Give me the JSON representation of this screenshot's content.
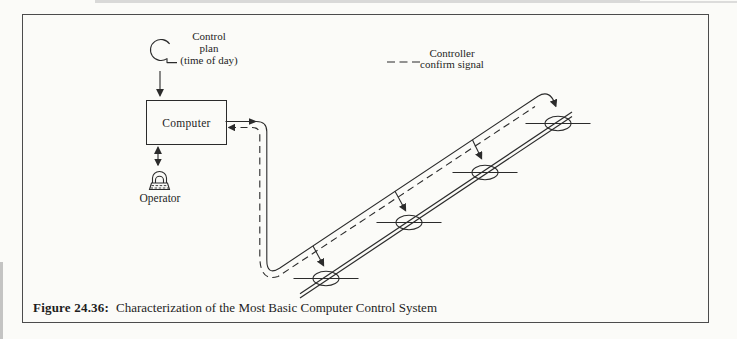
{
  "figure": {
    "caption_label": "Figure 24.36:",
    "caption_text": "Characterization of the Most Basic Computer Control System"
  },
  "diagram": {
    "control_plan": {
      "line1": "Control",
      "line2": "plan",
      "line3": "(time of day)"
    },
    "computer_label": "Computer",
    "operator_label": "Operator",
    "legend": {
      "line1": "Controller",
      "line2": "confirm signal"
    },
    "signalized_intersections_count": 4,
    "flows": {
      "command": "Computer to signalized intersections (solid line with arrows)",
      "confirm": "Controller confirm signal returns to Computer (dashed line)"
    },
    "colors": {
      "ink": "#2b2b2b",
      "background": "#fbfbf8"
    }
  }
}
